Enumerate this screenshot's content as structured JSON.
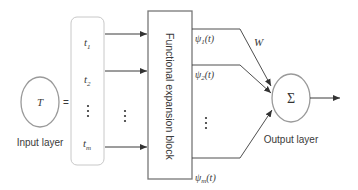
{
  "diagram": {
    "input": {
      "node_label": "T",
      "equals": "=",
      "layer_label": "Input layer",
      "vector": [
        {
          "base": "t",
          "sub": "1"
        },
        {
          "base": "t",
          "sub": "2"
        },
        {
          "base": "⋮",
          "sub": ""
        },
        {
          "base": "t",
          "sub": "m"
        }
      ],
      "arrow_ellipsis": "⋮"
    },
    "block": {
      "label": "Functional expansion block"
    },
    "expansions": [
      {
        "base": "ψ",
        "sub": "1",
        "arg": "(t)"
      },
      {
        "base": "ψ",
        "sub": "2",
        "arg": "(t)"
      },
      {
        "base": "⋮",
        "sub": "",
        "arg": ""
      },
      {
        "base": "ψ",
        "sub": "m",
        "arg": "(t)"
      }
    ],
    "weights_label": "W",
    "output": {
      "node_label": "Σ",
      "layer_label": "Output layer"
    },
    "colors": {
      "line": "#3a3a3a",
      "node_stroke": "#9a9a9a",
      "block_stroke": "#777777",
      "bracket_stroke": "#c8c8c8"
    }
  }
}
